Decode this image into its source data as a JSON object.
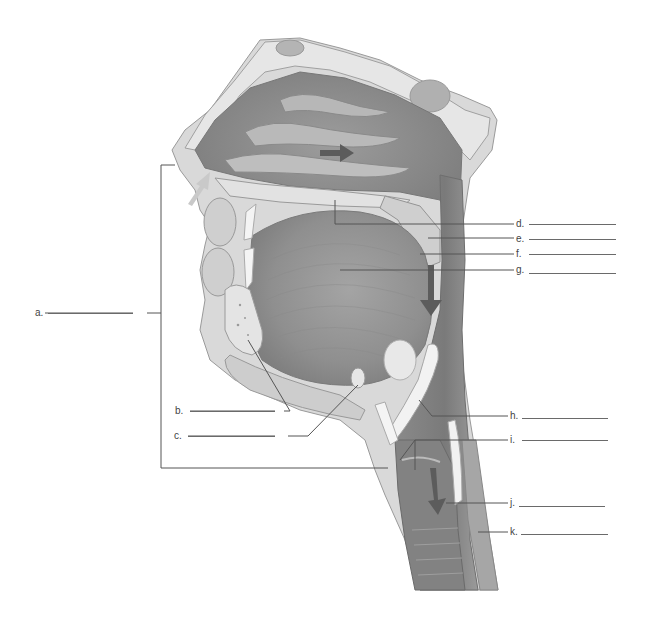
{
  "diagram": {
    "type": "anatomical-labeling-worksheet",
    "colors": {
      "background": "#ffffff",
      "tissue_light": "#dcdcdc",
      "tissue_mid": "#bdbdbd",
      "cavity_dark": "#8e8e8e",
      "airway_dark": "#7a7a7a",
      "bone_spots": "#9a9a9a",
      "cartilage_white": "#f4f4f4",
      "leader_line": "#555555",
      "arrow_light": "#c9c9c9",
      "arrow_dark": "#5c5c5c"
    },
    "labels": [
      {
        "id": "a",
        "text": "a."
      },
      {
        "id": "b",
        "text": "b."
      },
      {
        "id": "c",
        "text": "c."
      },
      {
        "id": "d",
        "text": "d."
      },
      {
        "id": "e",
        "text": "e."
      },
      {
        "id": "f",
        "text": "f."
      },
      {
        "id": "g",
        "text": "g."
      },
      {
        "id": "h",
        "text": "h."
      },
      {
        "id": "i",
        "text": "i."
      },
      {
        "id": "j",
        "text": "j."
      },
      {
        "id": "k",
        "text": "k."
      }
    ],
    "arrows": [
      {
        "name": "inhaled-air-arrow-nostril",
        "direction": "up-right"
      },
      {
        "name": "air-flow-arrow-nasal-cavity",
        "direction": "right"
      },
      {
        "name": "air-flow-arrow-pharynx",
        "direction": "down"
      },
      {
        "name": "air-flow-arrow-trachea",
        "direction": "down"
      }
    ]
  }
}
